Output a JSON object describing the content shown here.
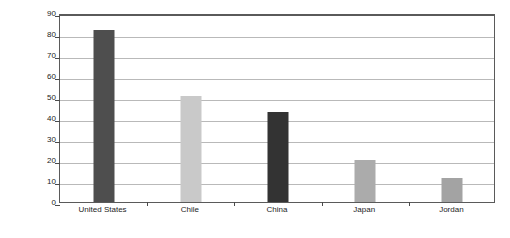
{
  "chart_data": {
    "type": "bar",
    "title": "",
    "xlabel": "",
    "ylabel": "Percentage",
    "categories": [
      "United States",
      "Chile",
      "China",
      "Japan",
      "Jordan"
    ],
    "values": [
      82,
      50.5,
      43,
      20,
      11.5
    ],
    "bar_colors": [
      "#4e4e4e",
      "#c9c9c9",
      "#333333",
      "#ababab",
      "#a3a3a3"
    ],
    "ylim": [
      0,
      90
    ],
    "yticks": [
      0,
      10,
      20,
      30,
      40,
      50,
      60,
      70,
      80,
      90
    ],
    "ytick_labels": [
      "0",
      "10",
      "20",
      "30",
      "40",
      "50",
      "60",
      "70",
      "80",
      "90"
    ],
    "grid": true,
    "grid_color": "#b9b9b9",
    "legend": null,
    "frame_color": "#5a5a5a",
    "background": "#ffffff",
    "text_color": "#1c1c1c"
  }
}
